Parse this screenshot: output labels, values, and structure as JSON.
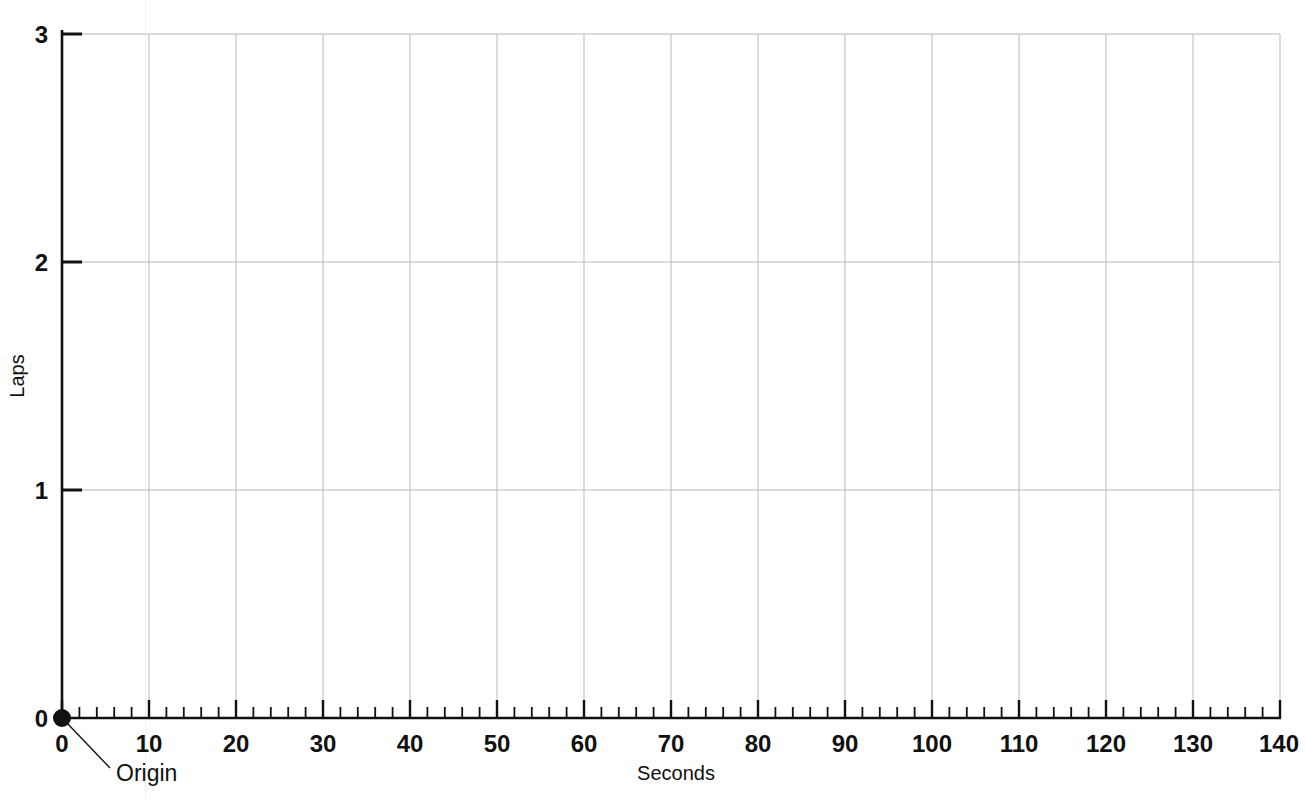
{
  "chart_data": {
    "type": "line",
    "title": "",
    "subtitle": "",
    "xlabel": "Seconds",
    "ylabel": "Laps",
    "xlim": [
      0,
      140
    ],
    "ylim": [
      0,
      3
    ],
    "x_major_ticks": [
      0,
      10,
      20,
      30,
      40,
      50,
      60,
      70,
      80,
      90,
      100,
      110,
      120,
      130,
      140
    ],
    "x_tick_labels": [
      "0",
      "10",
      "20",
      "30",
      "40",
      "50",
      "60",
      "70",
      "80",
      "90",
      "100",
      "110",
      "120",
      "130",
      "140"
    ],
    "x_minor_tick_step": 2,
    "y_major_ticks": [
      0,
      1,
      2,
      3
    ],
    "y_tick_labels": [
      "0",
      "1",
      "2",
      "3"
    ],
    "grid": {
      "vertical": true,
      "horizontal": true,
      "vertical_step": 10,
      "horizontal_step": 1,
      "color": "#b9b9b9"
    },
    "series": [],
    "values": [],
    "categories": [],
    "annotations": [
      {
        "label": "Origin",
        "x": 0,
        "y": 0,
        "marker": "filled-circle",
        "leader_line": true
      }
    ],
    "legend": {
      "visible": false,
      "position": "none",
      "entries": []
    }
  },
  "axes": {
    "y_axis_title": "Laps",
    "x_axis_title": "Seconds",
    "y_labels": [
      "3",
      "2",
      "1",
      "0"
    ],
    "x_labels": [
      "0",
      "10",
      "20",
      "30",
      "40",
      "50",
      "60",
      "70",
      "80",
      "90",
      "100",
      "110",
      "120",
      "130",
      "140"
    ]
  },
  "annotation": {
    "origin_label": "Origin"
  },
  "page": {
    "cut_off_header_text": "",
    "background_color": "#ffffff",
    "axis_color": "#111111",
    "grid_color": "#b9b9b9"
  }
}
